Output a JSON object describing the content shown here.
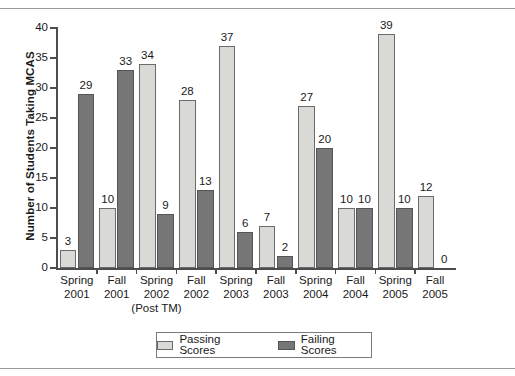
{
  "chart_data": {
    "type": "bar",
    "title": "",
    "xlabel": "",
    "ylabel": "Number of Students Taking MCAS",
    "ylim": [
      0,
      40
    ],
    "yticks": [
      0,
      5,
      10,
      15,
      20,
      25,
      30,
      35,
      40
    ],
    "grid": false,
    "legend_position": "bottom",
    "categories": [
      "Spring 2001",
      "Fall 2001",
      "Spring 2002 (Post TM)",
      "Fall 2002",
      "Spring 2003",
      "Fall 2003",
      "Spring 2004",
      "Fall 2004",
      "Spring 2005",
      "Fall 2005"
    ],
    "category_lines": [
      {
        "l1": "Spring",
        "l2": "2001",
        "l3": ""
      },
      {
        "l1": "Fall",
        "l2": "2001",
        "l3": ""
      },
      {
        "l1": "Spring",
        "l2": "2002",
        "l3": "(Post TM)"
      },
      {
        "l1": "Fall",
        "l2": "2002",
        "l3": ""
      },
      {
        "l1": "Spring",
        "l2": "2003",
        "l3": ""
      },
      {
        "l1": "Fall",
        "l2": "2003",
        "l3": ""
      },
      {
        "l1": "Spring",
        "l2": "2004",
        "l3": ""
      },
      {
        "l1": "Fall",
        "l2": "2004",
        "l3": ""
      },
      {
        "l1": "Spring",
        "l2": "2005",
        "l3": ""
      },
      {
        "l1": "Fall",
        "l2": "2005",
        "l3": ""
      }
    ],
    "series": [
      {
        "name": "Passing Scores",
        "color": "#d9d9d6",
        "values": [
          3,
          10,
          34,
          28,
          37,
          7,
          27,
          10,
          39,
          12
        ]
      },
      {
        "name": "Failing Scores",
        "color": "#767676",
        "values": [
          29,
          33,
          9,
          13,
          6,
          2,
          20,
          10,
          10,
          0
        ]
      }
    ]
  },
  "legend": {
    "items": [
      {
        "label": "Passing Scores",
        "swatch": "pass"
      },
      {
        "label": "Failing Scores",
        "swatch": "fail"
      }
    ]
  }
}
